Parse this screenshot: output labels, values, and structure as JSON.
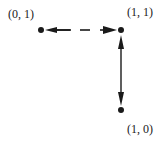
{
  "diagram": {
    "nodes": [
      {
        "id": "n01",
        "label": "(0, 1)",
        "x": 41,
        "y": 30
      },
      {
        "id": "n11",
        "label": "(1, 1)",
        "x": 121,
        "y": 30
      },
      {
        "id": "n10",
        "label": "(1, 0)",
        "x": 121,
        "y": 110
      }
    ],
    "edges": [
      {
        "from": "(1, 1)",
        "to": "(0, 1)",
        "style": "dashed",
        "arrows": "both"
      },
      {
        "from": "(1, 1)",
        "to": "(1, 0)",
        "style": "solid",
        "arrows": "both"
      }
    ],
    "colors": {
      "ink": "#1a1a1a",
      "background": "#ffffff"
    }
  }
}
